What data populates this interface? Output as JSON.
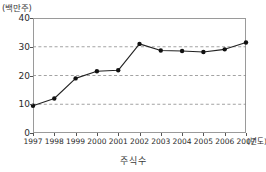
{
  "chart_data": {
    "type": "line",
    "title": "",
    "caption": "주식수",
    "ylabel": "(백만주)",
    "xlabel": "(년도)",
    "categories": [
      "1997",
      "1998",
      "1999",
      "2000",
      "2001",
      "2002",
      "2003",
      "2004",
      "2005",
      "2006",
      "2007"
    ],
    "values": [
      9.5,
      12.0,
      19.0,
      21.5,
      21.8,
      31.0,
      28.7,
      28.5,
      28.2,
      29.1,
      31.5
    ],
    "yticks": [
      0,
      10,
      20,
      30,
      40
    ],
    "ylim": [
      0,
      40
    ],
    "grid": "horizontal-dashed",
    "gridlines_at": [
      10,
      20,
      30
    ],
    "legend": "none",
    "series_color": "#222222",
    "marker": "filled-circle"
  },
  "axis": {
    "y_unit_label": "(백만주)",
    "x_unit_label": "(년도)"
  },
  "colors": {
    "line": "#222222",
    "marker": "#111111",
    "grid": "#8c8c8c",
    "frame": "#9a9a9a",
    "background": "#ffffff"
  }
}
